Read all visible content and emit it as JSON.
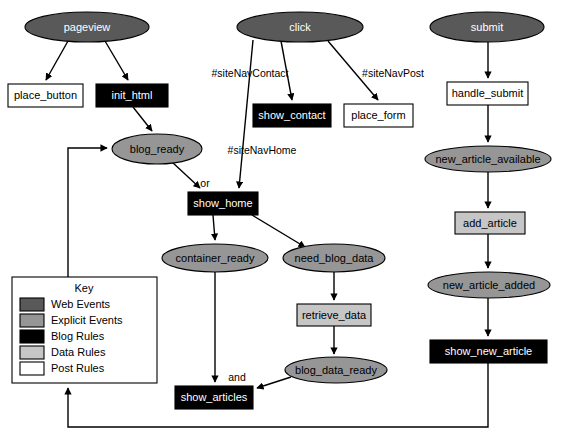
{
  "diagram": {
    "nodes": [
      {
        "id": "pageview",
        "label": "pageview",
        "shape": "ellipse",
        "category": "web-events",
        "fill": "#595959",
        "text": "#ffffff",
        "cx": 87,
        "cy": 27,
        "rx": 62,
        "ry": 15
      },
      {
        "id": "click",
        "label": "click",
        "shape": "ellipse",
        "category": "web-events",
        "fill": "#595959",
        "text": "#ffffff",
        "cx": 300,
        "cy": 27,
        "rx": 63,
        "ry": 15
      },
      {
        "id": "submit",
        "label": "submit",
        "shape": "ellipse",
        "category": "web-events",
        "fill": "#595959",
        "text": "#ffffff",
        "cx": 487,
        "cy": 27,
        "rx": 57,
        "ry": 15
      },
      {
        "id": "place_button",
        "label": "place_button",
        "shape": "rect",
        "category": "post-rules",
        "fill": "#ffffff",
        "text": "#000000",
        "x": 8,
        "y": 84,
        "w": 75,
        "h": 23
      },
      {
        "id": "init_html",
        "label": "init_html",
        "shape": "rect",
        "category": "blog-rules",
        "fill": "#000000",
        "text": "#ffffff",
        "x": 96,
        "y": 84,
        "w": 72,
        "h": 23
      },
      {
        "id": "show_contact",
        "label": "show_contact",
        "shape": "rect",
        "category": "blog-rules",
        "fill": "#000000",
        "text": "#ffffff",
        "x": 253,
        "y": 104,
        "w": 78,
        "h": 23
      },
      {
        "id": "place_form",
        "label": "place_form",
        "shape": "rect",
        "category": "post-rules",
        "fill": "#ffffff",
        "text": "#000000",
        "x": 344,
        "y": 104,
        "w": 69,
        "h": 23
      },
      {
        "id": "handle_submit",
        "label": "handle_submit",
        "shape": "rect",
        "category": "post-rules",
        "fill": "#ffffff",
        "text": "#000000",
        "x": 447,
        "y": 82,
        "w": 81,
        "h": 23
      },
      {
        "id": "blog_ready",
        "label": "blog_ready",
        "shape": "ellipse",
        "category": "explicit-events",
        "fill": "#969696",
        "text": "#000000",
        "cx": 157,
        "cy": 149,
        "rx": 45,
        "ry": 15
      },
      {
        "id": "show_home",
        "label": "show_home",
        "shape": "rect",
        "category": "blog-rules",
        "fill": "#000000",
        "text": "#ffffff",
        "x": 188,
        "y": 192,
        "w": 70,
        "h": 23
      },
      {
        "id": "new_article_available",
        "label": "new_article_available",
        "shape": "ellipse",
        "category": "explicit-events",
        "fill": "#969696",
        "text": "#000000",
        "cx": 488,
        "cy": 159,
        "rx": 63,
        "ry": 13
      },
      {
        "id": "container_ready",
        "label": "container_ready",
        "shape": "ellipse",
        "category": "explicit-events",
        "fill": "#969696",
        "text": "#000000",
        "cx": 215,
        "cy": 258,
        "rx": 53,
        "ry": 14
      },
      {
        "id": "need_blog_data",
        "label": "need_blog_data",
        "shape": "ellipse",
        "category": "explicit-events",
        "fill": "#969696",
        "text": "#000000",
        "cx": 334,
        "cy": 258,
        "rx": 51,
        "ry": 14
      },
      {
        "id": "add_article",
        "label": "add_article",
        "shape": "rect",
        "category": "data-rules",
        "fill": "#c6c6c6",
        "text": "#000000",
        "x": 455,
        "y": 212,
        "w": 70,
        "h": 22
      },
      {
        "id": "retrieve_data",
        "label": "retrieve_data",
        "shape": "rect",
        "category": "data-rules",
        "fill": "#c6c6c6",
        "text": "#000000",
        "x": 297,
        "y": 304,
        "w": 74,
        "h": 22
      },
      {
        "id": "new_article_added",
        "label": "new_article_added",
        "shape": "ellipse",
        "category": "explicit-events",
        "fill": "#969696",
        "text": "#000000",
        "cx": 489,
        "cy": 285,
        "rx": 61,
        "ry": 13
      },
      {
        "id": "blog_data_ready",
        "label": "blog_data_ready",
        "shape": "ellipse",
        "category": "explicit-events",
        "fill": "#969696",
        "text": "#000000",
        "cx": 336,
        "cy": 370,
        "rx": 51,
        "ry": 13
      },
      {
        "id": "show_new_article",
        "label": "show_new_article",
        "shape": "rect",
        "category": "blog-rules",
        "fill": "#000000",
        "text": "#ffffff",
        "x": 430,
        "y": 340,
        "w": 117,
        "h": 23
      },
      {
        "id": "show_articles",
        "label": "show_articles",
        "shape": "rect",
        "category": "blog-rules",
        "fill": "#000000",
        "text": "#ffffff",
        "x": 175,
        "y": 386,
        "w": 78,
        "h": 23
      }
    ],
    "edges": [
      {
        "from": "pageview",
        "to": "place_button",
        "label": ""
      },
      {
        "from": "pageview",
        "to": "init_html",
        "label": ""
      },
      {
        "from": "init_html",
        "to": "blog_ready",
        "label": ""
      },
      {
        "from": "click",
        "to": "show_contact",
        "label": "#siteNavContact"
      },
      {
        "from": "click",
        "to": "place_form",
        "label": "#siteNavPost"
      },
      {
        "from": "click",
        "to": "show_home",
        "label": "#siteNavHome"
      },
      {
        "from": "blog_ready",
        "to": "show_home",
        "label": "or"
      },
      {
        "from": "show_home",
        "to": "container_ready",
        "label": ""
      },
      {
        "from": "show_home",
        "to": "need_blog_data",
        "label": ""
      },
      {
        "from": "need_blog_data",
        "to": "retrieve_data",
        "label": ""
      },
      {
        "from": "retrieve_data",
        "to": "blog_data_ready",
        "label": ""
      },
      {
        "from": "container_ready",
        "to": "show_articles",
        "label": "and"
      },
      {
        "from": "blog_data_ready",
        "to": "show_articles",
        "label": ""
      },
      {
        "from": "submit",
        "to": "handle_submit",
        "label": ""
      },
      {
        "from": "handle_submit",
        "to": "new_article_available",
        "label": ""
      },
      {
        "from": "new_article_available",
        "to": "add_article",
        "label": ""
      },
      {
        "from": "add_article",
        "to": "new_article_added",
        "label": ""
      },
      {
        "from": "new_article_added",
        "to": "show_new_article",
        "label": ""
      },
      {
        "from": "show_new_article",
        "to": "blog_ready",
        "label": ""
      }
    ],
    "edge_labels": {
      "site_nav_contact": "#siteNavContact",
      "site_nav_post": "#siteNavPost",
      "site_nav_home": "#siteNavHome",
      "or": "or",
      "and": "and"
    }
  },
  "key": {
    "title": "Key",
    "items": [
      {
        "label": "Web Events",
        "color": "#595959"
      },
      {
        "label": "Explicit Events",
        "color": "#969696"
      },
      {
        "label": "Blog Rules",
        "color": "#000000"
      },
      {
        "label": "Data Rules",
        "color": "#c6c6c6"
      },
      {
        "label": "Post Rules",
        "color": "#ffffff"
      }
    ]
  }
}
